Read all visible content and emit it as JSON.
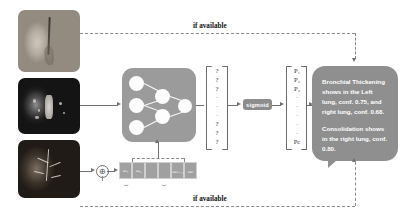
{
  "figure": {
    "inputs": [
      {
        "name": "lung-3d-render",
        "label": "3D lung volume rendering"
      },
      {
        "name": "ct-axial-slice",
        "label": "Axial chest CT slice"
      },
      {
        "name": "angiography-scan",
        "label": "Pulmonary angiography scan"
      }
    ],
    "network": {
      "label": "neural-network",
      "input_nodes": 3,
      "hidden_nodes": 2,
      "output_nodes": 1
    },
    "logits": {
      "items": [
        "?",
        "?",
        "?",
        "·",
        "·",
        "·",
        "?",
        "?",
        "?"
      ],
      "top": [
        "?",
        "?",
        "?"
      ],
      "bottom": [
        "?",
        "?",
        "?"
      ],
      "ellipsis": "·"
    },
    "activation": {
      "label": "sigmoid"
    },
    "probabilities": {
      "top": [
        "P₁",
        "P₂",
        "P₃"
      ],
      "ellipsis": "·",
      "last": "Pc"
    },
    "fusion": {
      "operator": "⊕",
      "label": "concatenation"
    },
    "feature_strip": {
      "cells": [
        "ω₁",
        "ω₂",
        "",
        "",
        "ωₙ₋₁",
        "ωₙ"
      ],
      "brace_left_label": "image features",
      "brace_right_label": "metadata"
    },
    "report": {
      "paragraphs": [
        "Bronchial Thickening shows in the Left lung, conf. 0.75, and right lung, conf. 0.68.",
        "Consolidation shows in the right lung, conf. 0.80."
      ]
    },
    "captions": {
      "top": "if available",
      "bottom": "if available"
    },
    "colors": {
      "block_gray": "#9b9b9b",
      "bubble_gray": "#8f8f8f",
      "chip_gray": "#8d8d8d",
      "line_gray": "#6f6f6f",
      "dash_gray": "#8a8a8a"
    }
  }
}
